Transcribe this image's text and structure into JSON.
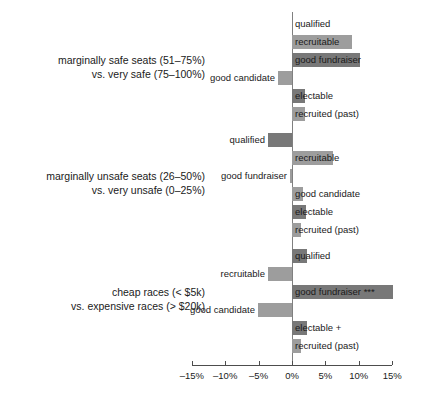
{
  "chart_data": {
    "type": "bar",
    "title": "",
    "subtitle": "",
    "xlabel": "",
    "ylabel": "",
    "orientation": "horizontal",
    "xlim": [
      -17.5,
      16.5
    ],
    "xticks": [
      -15,
      -10,
      -5,
      0,
      5,
      10,
      15
    ],
    "xticklabels": [
      "–15%",
      "–10%",
      "–5%",
      "0%",
      "5%",
      "10%",
      "15%"
    ],
    "grid": false,
    "legend": "none",
    "zero_line": true,
    "categories": [
      "qualified",
      "recruitable",
      "good fundraiser",
      "good candidate",
      "electable",
      "recruited (past)"
    ],
    "groups": [
      {
        "id": "group-safe-seats",
        "label_line1": "marginally safe seats (51–75%)",
        "label_line2": "vs. very safe (75–100%)",
        "bars": [
          {
            "label": "qualified",
            "value": 0.0,
            "shade": "light"
          },
          {
            "label": "recruitable",
            "value": 9.0,
            "shade": "light"
          },
          {
            "label": "good fundraiser",
            "value": 10.2,
            "shade": "dark"
          },
          {
            "label": "good candidate",
            "value": -2.1,
            "shade": "light"
          },
          {
            "label": "electable",
            "value": 2.0,
            "shade": "dark"
          },
          {
            "label": "recruited (past)",
            "value": 1.9,
            "shade": "light"
          }
        ]
      },
      {
        "id": "group-unsafe-seats",
        "label_line1": "marginally unsafe seats (26–50%)",
        "label_line2": "vs. very unsafe (0–25%)",
        "bars": [
          {
            "label": "qualified",
            "value": -3.6,
            "shade": "dark"
          },
          {
            "label": "recruitable",
            "value": 6.2,
            "shade": "light"
          },
          {
            "label": "good fundraiser",
            "value": -0.3,
            "shade": "light"
          },
          {
            "label": "good candidate",
            "value": 1.6,
            "shade": "light"
          },
          {
            "label": "electable",
            "value": 2.1,
            "shade": "dark"
          },
          {
            "label": "recruited (past)",
            "value": 1.3,
            "shade": "light"
          }
        ]
      },
      {
        "id": "group-cheap-races",
        "label_line1": "cheap races (< $5k)",
        "label_line2": "vs. expensive races (> $20k)",
        "bars": [
          {
            "label": "qualified",
            "value": 2.3,
            "shade": "dark"
          },
          {
            "label": "recruitable",
            "value": -3.6,
            "shade": "light"
          },
          {
            "label": "good fundraiser ***",
            "value": 15.1,
            "shade": "dark"
          },
          {
            "label": "good candidate",
            "value": -5.1,
            "shade": "light"
          },
          {
            "label": "electable +",
            "value": 2.2,
            "shade": "dark"
          },
          {
            "label": "recruited (past)",
            "value": 1.3,
            "shade": "light"
          }
        ]
      }
    ],
    "colors": {
      "bar_light": "#9d9d9d",
      "bar_dark": "#787878",
      "axis": "#4d4d4d",
      "zero_line": "#808080",
      "text": "#1a1a1a",
      "background": "#ffffff"
    }
  }
}
